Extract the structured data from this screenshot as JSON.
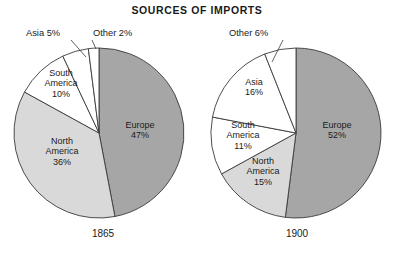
{
  "figure": {
    "title": "SOURCES OF IMPORTS",
    "background": "#ffffff"
  },
  "palette": {
    "europe": "#a6a6a6",
    "north_america": "#d9d9d9",
    "south_america": "#ffffff",
    "asia": "#ffffff",
    "other": "#ffffff",
    "outline": "#3a3a3a",
    "text": "#1a1a1a"
  },
  "chart_data": [
    {
      "type": "pie",
      "title": "SOURCES OF IMPORTS",
      "subtitle": "1865",
      "year": "1865",
      "categories": [
        "Europe",
        "North America",
        "South America",
        "Asia",
        "Other"
      ],
      "values": [
        47,
        36,
        10,
        5,
        2
      ],
      "unit": "%",
      "start_angle_deg": 0,
      "direction": "clockwise",
      "legend": "none",
      "slices": [
        {
          "label": "Europe",
          "value": 47,
          "value_text": "47%",
          "label_lines": [
            "Europe",
            "47%"
          ],
          "color": "#a6a6a6",
          "label_placement": "inside",
          "label_x": 140,
          "label_y": 131
        },
        {
          "label": "North America",
          "value": 36,
          "value_text": "36%",
          "label_lines": [
            "North",
            "America",
            "36%"
          ],
          "color": "#d9d9d9",
          "label_placement": "inside",
          "label_x": 62,
          "label_y": 152
        },
        {
          "label": "South America",
          "value": 10,
          "value_text": "10%",
          "label_lines": [
            "South",
            "America",
            "10%"
          ],
          "color": "#ffffff",
          "label_placement": "inside",
          "label_x": 61,
          "label_y": 84
        },
        {
          "label": "Asia",
          "value": 5,
          "value_text": "5%",
          "label_lines": [
            "Asia 5%"
          ],
          "color": "#ffffff",
          "label_placement": "outside",
          "label_x": 26,
          "label_y": 36,
          "leader": [
            [
              71,
              40
            ],
            [
              86,
              57
            ]
          ]
        },
        {
          "label": "Other",
          "value": 2,
          "value_text": "2%",
          "label_lines": [
            "Other 2%"
          ],
          "color": "#ffffff",
          "label_placement": "outside",
          "label_x": 93,
          "label_y": 36,
          "leader": [
            [
              92,
              40
            ],
            [
              96,
              49
            ]
          ]
        }
      ]
    },
    {
      "type": "pie",
      "title": "SOURCES OF IMPORTS",
      "subtitle": "1900",
      "year": "1900",
      "categories": [
        "Europe",
        "North America",
        "South America",
        "Asia",
        "Other"
      ],
      "values": [
        52,
        15,
        11,
        16,
        6
      ],
      "unit": "%",
      "start_angle_deg": 0,
      "direction": "clockwise",
      "legend": "none",
      "slices": [
        {
          "label": "Europe",
          "value": 52,
          "value_text": "52%",
          "label_lines": [
            "Europe",
            "52%"
          ],
          "color": "#a6a6a6",
          "label_placement": "inside",
          "label_x": 337,
          "label_y": 131
        },
        {
          "label": "North America",
          "value": 15,
          "value_text": "15%",
          "label_lines": [
            "North",
            "America",
            "15%"
          ],
          "color": "#d9d9d9",
          "label_placement": "inside",
          "label_x": 263,
          "label_y": 172
        },
        {
          "label": "South America",
          "value": 11,
          "value_text": "11%",
          "label_lines": [
            "South",
            "America",
            "11%"
          ],
          "color": "#ffffff",
          "label_placement": "inside",
          "label_x": 243,
          "label_y": 136
        },
        {
          "label": "Asia",
          "value": 16,
          "value_text": "16%",
          "label_lines": [
            "Asia",
            "16%"
          ],
          "color": "#ffffff",
          "label_placement": "inside",
          "label_x": 254,
          "label_y": 88
        },
        {
          "label": "Other",
          "value": 6,
          "value_text": "6%",
          "label_lines": [
            "Other 6%"
          ],
          "color": "#ffffff",
          "label_placement": "outside",
          "label_x": 229,
          "label_y": 36,
          "leader": [
            [
              283,
              40
            ],
            [
              272,
              62
            ]
          ]
        }
      ]
    }
  ],
  "geometry": {
    "title_x": 197,
    "title_y": 14,
    "pies": [
      {
        "cx": 99,
        "cy": 133,
        "r": 85,
        "year_x": 103,
        "year_y": 237
      },
      {
        "cx": 296,
        "cy": 133,
        "r": 85,
        "year_x": 297,
        "year_y": 237
      }
    ]
  }
}
